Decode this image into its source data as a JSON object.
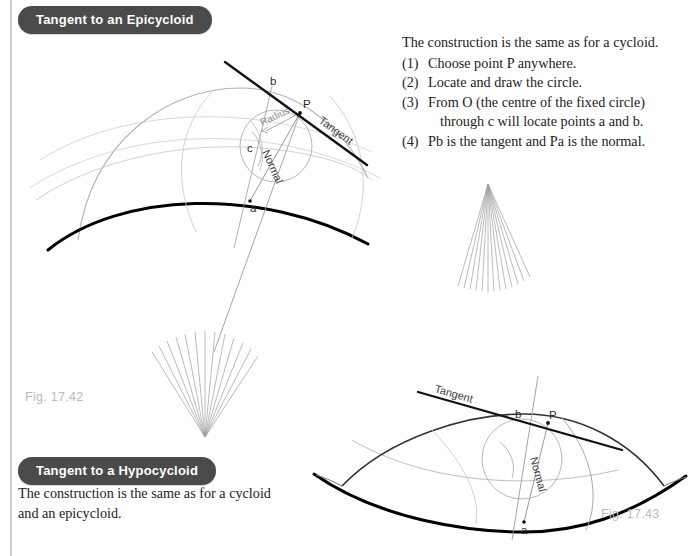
{
  "page": {
    "background": "#ffffff",
    "edge_rule_color": "#c9c9c9"
  },
  "headings": {
    "epicycloid": "Tangent to an Epicycloid",
    "hypocycloid": "Tangent to a Hypocycloid",
    "pill_bg": "#4a4a4a",
    "pill_text_color": "#ffffff"
  },
  "instructions": {
    "lead": "The construction is the same as for a cycloid.",
    "items": [
      {
        "num": "(1)",
        "text": "Choose point P anywhere.",
        "cont": ""
      },
      {
        "num": "(2)",
        "text": "Locate and draw the circle.",
        "cont": ""
      },
      {
        "num": "(3)",
        "text": "From O (the centre of the fixed circle)",
        "cont": "through c will locate points a and b."
      },
      {
        "num": "(4)",
        "text": "Pb is the tangent and Pa is the normal.",
        "cont": ""
      }
    ]
  },
  "hypocycloid_text": {
    "line1": "The construction is the same as for a cycloid",
    "line2": "and an epicycloid."
  },
  "captions": {
    "fig_epicycloid": "Fig. 17.42",
    "fig_hypocycloid": "Fig. 17.43",
    "color": "#b9b9b9"
  },
  "figure_epicycloid": {
    "labels": {
      "b": "b",
      "P": "P",
      "c": "c",
      "a": "a",
      "radius": "Radius",
      "normal": "Normal",
      "tangent": "Tangent"
    },
    "colors": {
      "base_curve": "#000000",
      "epicycloid_curve": "#b0b0b0",
      "construction": "#a8a8a8",
      "tangent_line": "#111111",
      "fan_lines": "#9a9a9a"
    },
    "fan_line_count": 13,
    "fan_apex": {
      "x": 205,
      "y": 437
    }
  },
  "figure_hypocycloid": {
    "labels": {
      "b": "b",
      "P": "P",
      "a": "a",
      "normal": "Normal",
      "tangent": "Tangent"
    },
    "colors": {
      "base_curve": "#000000",
      "hypocycloid_curve": "#ababab",
      "construction": "#a8a8a8",
      "tangent_line": "#111111",
      "fan_lines": "#9a9a9a"
    },
    "fan_line_count": 13,
    "fan_apex": {
      "x": 488,
      "y": 184
    }
  }
}
